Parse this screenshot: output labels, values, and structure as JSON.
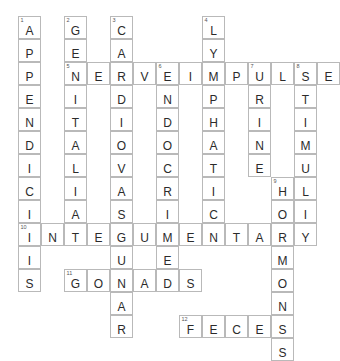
{
  "puzzle": {
    "title": "Anatomy Crossword Grid",
    "grid": {
      "origin_x": 18,
      "origin_y": 16,
      "cell_size": 23,
      "cols": 14,
      "rows": 14
    },
    "entries": [
      {
        "number": "1",
        "answer": "APPENDICITIS",
        "direction": "down",
        "col": 0,
        "row": 0
      },
      {
        "number": "2",
        "answer": "GENITALIA",
        "direction": "down",
        "col": 2,
        "row": 0
      },
      {
        "number": "3",
        "answer": "CARDIOVASCULAR",
        "direction": "down",
        "col": 4,
        "row": 0
      },
      {
        "number": "4",
        "answer": "LYMPHATIC",
        "direction": "down",
        "col": 8,
        "row": 0
      },
      {
        "number": "5",
        "answer": "NERVEIMPULSE",
        "direction": "across",
        "col": 2,
        "row": 2
      },
      {
        "number": "6",
        "answer": "ENDOCRINE",
        "direction": "down",
        "col": 6,
        "row": 2
      },
      {
        "number": "7",
        "answer": "URINE",
        "direction": "down",
        "col": 10,
        "row": 2
      },
      {
        "number": "8",
        "answer": "STIMULI",
        "direction": "down",
        "col": 12,
        "row": 2
      },
      {
        "number": "9",
        "answer": "HORMONES",
        "direction": "down",
        "col": 11,
        "row": 7
      },
      {
        "number": "10",
        "answer": "INTEGUMENTARY",
        "direction": "across",
        "col": 0,
        "row": 9
      },
      {
        "number": "11",
        "answer": "GONADS",
        "direction": "across",
        "col": 2,
        "row": 11
      },
      {
        "number": "12",
        "answer": "FECES",
        "direction": "across",
        "col": 7,
        "row": 13
      }
    ],
    "colors": {
      "cell_border": "#b9b9b9",
      "letter": "#2b2b2b",
      "number": "#555555",
      "background": "#ffffff"
    }
  }
}
